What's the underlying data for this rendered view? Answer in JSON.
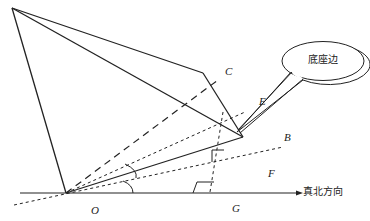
{
  "diagram": {
    "type": "geometric-orientation-diagram",
    "callout": {
      "text": "底座边"
    },
    "axis": {
      "label": "真北方向"
    },
    "points": {
      "C": "C",
      "E": "E",
      "B": "B",
      "F": "F",
      "O": "O",
      "G": "G"
    },
    "colors": {
      "stroke": "#222222",
      "background": "#ffffff"
    }
  }
}
